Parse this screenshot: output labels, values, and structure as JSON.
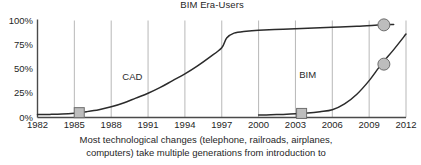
{
  "chart_data": {
    "type": "line",
    "title": "BIM Era-Users",
    "xlabel": "",
    "ylabel": "",
    "xlim": [
      1982,
      2012
    ],
    "ylim": [
      0,
      100
    ],
    "grid": true,
    "legend": "none",
    "xticks": [
      "1982",
      "1985",
      "1988",
      "1991",
      "1994",
      "1997",
      "2000",
      "2003",
      "2006",
      "2009",
      "2012"
    ],
    "yticks": [
      "0%",
      "25%",
      "50%",
      "75%",
      "100%"
    ],
    "annotations": [
      {
        "text": "CAD",
        "x": 1989.8,
        "y": 42
      },
      {
        "text": "BIM",
        "x": 2004.2,
        "y": 44
      }
    ],
    "series": [
      {
        "name": "CAD",
        "x": [
          1982,
          1983,
          1984,
          1985,
          1986,
          1987,
          1988,
          1989,
          1990,
          1991,
          1992,
          1993,
          1994,
          1995,
          1996,
          1997,
          1997.4,
          1998,
          1999,
          2000,
          2002,
          2004,
          2006,
          2008,
          2010,
          2011
        ],
        "values": [
          3,
          3.2,
          3.6,
          4.5,
          6,
          8,
          11,
          15,
          20,
          25,
          31,
          38,
          45,
          53,
          62,
          72,
          82,
          87,
          89,
          90,
          91,
          92,
          93,
          94,
          95.5,
          96
        ],
        "markers": [
          {
            "type": "square",
            "x": 1985.4,
            "y": 5
          },
          {
            "type": "circle",
            "x": 2010.2,
            "y": 95.5
          }
        ]
      },
      {
        "name": "BIM",
        "x": [
          2000,
          2001,
          2002,
          2003,
          2004,
          2005,
          2006,
          2007,
          2008,
          2009,
          2010,
          2011,
          2012
        ],
        "values": [
          2.5,
          2.8,
          3.2,
          3.8,
          4.6,
          6,
          8,
          14,
          24,
          38,
          55,
          70,
          86
        ],
        "markers": [
          {
            "type": "square",
            "x": 2003.5,
            "y": 4.2
          },
          {
            "type": "circle",
            "x": 2010.2,
            "y": 55
          }
        ]
      }
    ]
  },
  "caption": {
    "line1": "Most technological changes (telephone, railroads, airplanes,",
    "line2": "computers) take multiple generations from introduction to"
  },
  "colors": {
    "line": "#2b2b2b",
    "marker_fill": "#bdbdbd",
    "marker_stroke": "#6e6e6e",
    "grid": "#9a9a9a",
    "axis": "#4a4a4a",
    "text": "#1f1f1f"
  }
}
